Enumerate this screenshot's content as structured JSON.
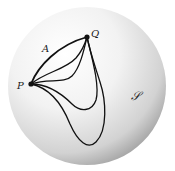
{
  "figure": {
    "sphere": {
      "label": "𝒮",
      "center": [
        87,
        86
      ],
      "radius": 79,
      "highlight_color": "#ffffff",
      "shadow_color": "#9a9a9a"
    },
    "points": [
      {
        "name": "P",
        "label": "P",
        "x": 31,
        "y": 84
      },
      {
        "name": "Q",
        "label": "Q",
        "x": 87,
        "y": 37
      }
    ],
    "curves": [
      {
        "name": "A",
        "label": "A",
        "d": "M31,84 C38,66 58,45 87,37"
      },
      {
        "name": "curve-2",
        "d": "M31,84 C45,72 65,70 76,58 C82,51 85,44 87,37"
      },
      {
        "name": "curve-3",
        "d": "M31,84 C48,78 64,84 72,76 C80,68 84,50 87,37"
      },
      {
        "name": "curve-4",
        "d": "M31,84 C50,84 64,96 72,104 C80,112 92,112 96,100 C100,86 92,58 87,37"
      },
      {
        "name": "curve-5",
        "d": "M31,84 C50,88 62,104 70,124 C78,142 88,150 96,142 C108,130 106,100 100,82 C95,66 90,52 87,37"
      }
    ],
    "stroke_color": "#111111"
  }
}
